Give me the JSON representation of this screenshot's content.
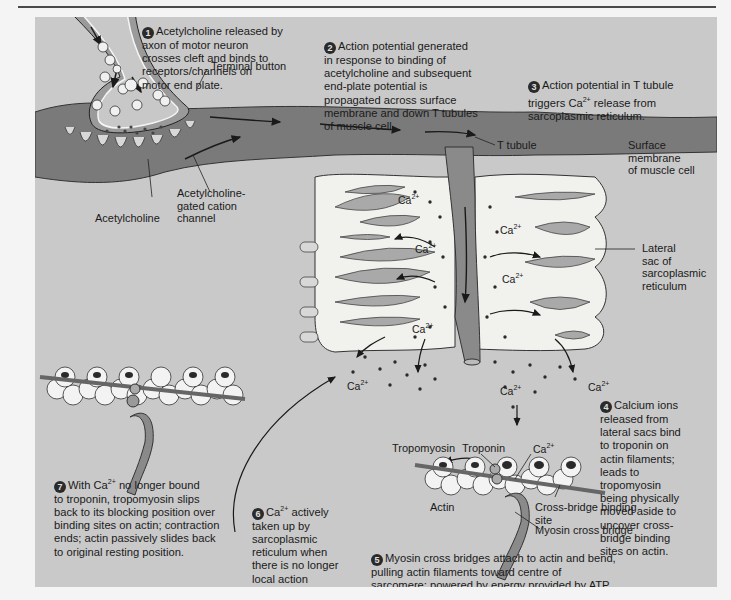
{
  "figure": {
    "colors": {
      "panel_bg": "#c9c9c9",
      "membrane": "#7a7a7a",
      "sr_sac": "#f1f1ee",
      "sac_lumen": "#a9a9a9",
      "ink": "#1a1a1a",
      "step_badge": "#2a2a2a"
    }
  },
  "steps": [
    {
      "number": "1",
      "text": "Acetylcholine released by\naxon of motor neuron\ncrosses cleft and binds to\nreceptors/channels on\nmotor end plate."
    },
    {
      "number": "2",
      "text": "Action potential generated\nin response to binding of\nacetylcholine and subsequent\nend-plate potential is\npropagated across surface\nmembrane and down T tubules\nof muscle cell."
    },
    {
      "number": "3",
      "text_before": "Action potential in T tubule\ntriggers Ca",
      "sup": "2+",
      "text_after": " release from\nsarcoplasmic reticulum."
    },
    {
      "number": "4",
      "text": "Calcium ions\nreleased from\nlateral sacs bind\nto troponin on\nactin filaments;\nleads to\ntropomyosin\nbeing physically\nmoved aside to\nuncover cross-\nbridge binding\nsites on actin."
    },
    {
      "number": "5",
      "text": "Myosin cross bridges attach to actin and bend,\npulling actin filaments toward centre of\nsarcomere; powered by energy provided by ATP."
    },
    {
      "number": "6",
      "text_before": "Ca",
      "sup": "2+",
      "text_after": " actively\ntaken up by\nsarcoplasmic\nreticulum when\nthere is no longer\nlocal action\npotential."
    },
    {
      "number": "7",
      "text_before": "With Ca",
      "sup": "2+",
      "text_after": " no longer bound\nto troponin, tropomyosin slips\nback to its blocking position over\nbinding sites on actin; contraction\nends; actin passively slides back\nto original resting position."
    }
  ],
  "labels": {
    "terminal_button": "Terminal button",
    "acetylcholine": "Acetylcholine",
    "ach_channel": "Acetylcholine-\ngated cation\nchannel",
    "t_tubule": "T tubule",
    "surface_membrane": "Surface membrane\nof muscle cell",
    "lateral_sac": "Lateral\nsac of\nsarcoplasmic\nreticulum",
    "tropomyosin": "Tropomyosin",
    "troponin": "Troponin",
    "actin": "Actin",
    "cross_bridge_site": "Cross-bridge binding\nsite",
    "myosin_cross_bridge": "Myosin cross bridge"
  },
  "calcium": {
    "base": "Ca",
    "charge": "2+"
  }
}
